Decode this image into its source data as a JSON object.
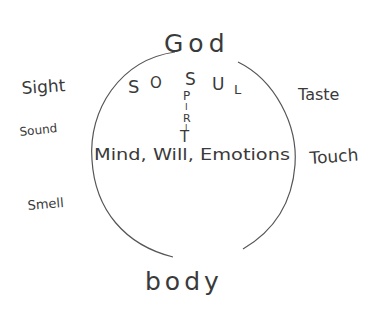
{
  "diagram": {
    "title_top": "God",
    "title_bottom": "body",
    "soul_label": [
      "S",
      "O",
      "S",
      "U",
      "L"
    ],
    "soul_word": "SOUL",
    "spirit_vertical": [
      "S",
      "P",
      "I",
      "R",
      "I",
      "T"
    ],
    "spirit_word": "SPIRIT",
    "inner_text": "Mind, Will, Emotions",
    "senses_left": [
      "Sight",
      "Sound",
      "Smell"
    ],
    "senses_right": [
      "Taste",
      "Touch"
    ],
    "ink_color": "#3a3a3a",
    "background": "#ffffff"
  }
}
